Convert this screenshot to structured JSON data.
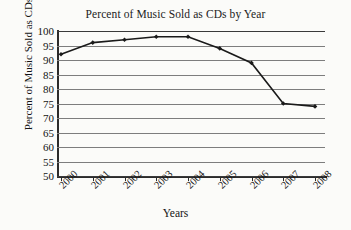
{
  "chart_data": {
    "type": "line",
    "title": "Percent of Music Sold as CDs by Year",
    "xlabel": "Years",
    "ylabel": "Percent of Music Sold as CDs",
    "categories": [
      "2000",
      "2001",
      "2002",
      "2003",
      "2004",
      "2005",
      "2006",
      "2007",
      "2008"
    ],
    "x": [
      2000,
      2001,
      2002,
      2003,
      2004,
      2005,
      2006,
      2007,
      2008
    ],
    "values": [
      92,
      96,
      97,
      98,
      98,
      94,
      89,
      75,
      74
    ],
    "series": [
      {
        "name": "Percent of Music Sold as CDs",
        "values": [
          92,
          96,
          97,
          98,
          98,
          94,
          89,
          75,
          74
        ]
      }
    ],
    "ylim": [
      50,
      100
    ],
    "ytick_labels": [
      "100",
      "95",
      "90",
      "85",
      "80",
      "75",
      "70",
      "65",
      "60",
      "55",
      "50"
    ],
    "yticks": [
      100,
      95,
      90,
      85,
      80,
      75,
      70,
      65,
      60,
      55,
      50
    ],
    "ytick_step": 5,
    "grid": "horizontal",
    "legend": "none",
    "marker": "filled-diamond",
    "line_color": "#1a1a1a",
    "grid_color": "#7d7d7d",
    "background_color": "#fbfbf9",
    "axis_color": "#2b2b2b"
  }
}
